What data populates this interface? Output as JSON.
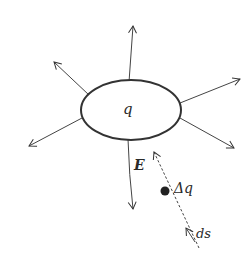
{
  "diagram": {
    "charge_label": "q",
    "field_label": "E",
    "small_charge_label": "Δq",
    "path_element_label": "ds",
    "stroke_color": "#333333",
    "background": "#ffffff"
  }
}
